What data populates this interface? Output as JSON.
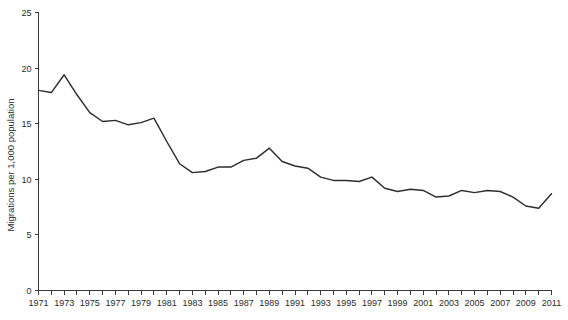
{
  "chart_data": {
    "type": "line",
    "title": "",
    "subtitle": "",
    "xlabel": "",
    "ylabel": "Migrations per 1,000 population",
    "xlim": [
      1971,
      2011
    ],
    "ylim": [
      0,
      25
    ],
    "grid": false,
    "legend": null,
    "y_ticks": [
      0,
      5,
      10,
      15,
      20,
      25
    ],
    "y_tick_labels": [
      "0",
      "5",
      "10",
      "15",
      "20",
      "25"
    ],
    "x_tick_labels": [
      "1971",
      "1973",
      "1975",
      "1977",
      "1979",
      "1981",
      "1983",
      "1985",
      "1987",
      "1989",
      "1991",
      "1993",
      "1995",
      "1997",
      "1999",
      "2001",
      "2003",
      "2005",
      "2007",
      "2009",
      "2011"
    ],
    "x_minor_ticks_every_year": true,
    "series": [
      {
        "name": "Migration rate",
        "color": "#2e2e2e",
        "x": [
          1971,
          1972,
          1973,
          1974,
          1975,
          1976,
          1977,
          1978,
          1979,
          1980,
          1981,
          1982,
          1983,
          1984,
          1985,
          1986,
          1987,
          1988,
          1989,
          1990,
          1991,
          1992,
          1993,
          1994,
          1995,
          1996,
          1997,
          1998,
          1999,
          2000,
          2001,
          2002,
          2003,
          2004,
          2005,
          2006,
          2007,
          2008,
          2009,
          2010,
          2011
        ],
        "values": [
          18.0,
          17.8,
          19.4,
          17.6,
          16.0,
          15.2,
          15.3,
          14.9,
          15.1,
          15.5,
          13.4,
          11.4,
          10.6,
          10.7,
          11.1,
          11.1,
          11.7,
          11.9,
          12.8,
          11.6,
          11.2,
          11.0,
          10.2,
          9.9,
          9.9,
          9.8,
          10.2,
          9.2,
          8.9,
          9.1,
          9.0,
          8.4,
          8.5,
          9.0,
          8.8,
          9.0,
          8.9,
          8.4,
          7.6,
          7.4,
          8.7
        ]
      }
    ]
  }
}
